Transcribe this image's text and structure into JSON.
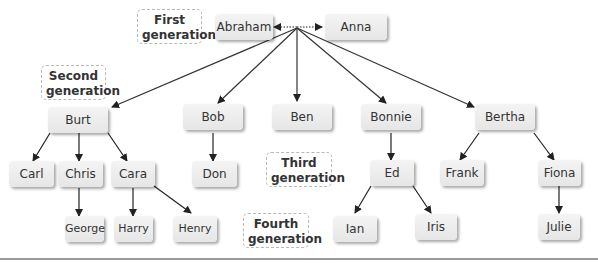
{
  "generation_labels": {
    "first": "First generation",
    "second": "Second generation",
    "third": "Third generation",
    "fourth": "Fourth generation"
  },
  "nodes": {
    "abraham": "Abraham",
    "anna": "Anna",
    "burt": "Burt",
    "bob": "Bob",
    "ben": "Ben",
    "bonnie": "Bonnie",
    "bertha": "Bertha",
    "carl": "Carl",
    "chris": "Chris",
    "cara": "Cara",
    "don": "Don",
    "ed": "Ed",
    "frank": "Frank",
    "fiona": "Fiona",
    "george": "George",
    "harry": "Harry",
    "henry": "Henry",
    "ian": "Ian",
    "iris": "Iris",
    "julie": "Julie"
  },
  "relationships": [
    {
      "from": "Abraham",
      "to": "Anna",
      "type": "spouse"
    },
    {
      "from": "Abraham/Anna",
      "to": "Burt",
      "type": "child"
    },
    {
      "from": "Abraham/Anna",
      "to": "Bob",
      "type": "child"
    },
    {
      "from": "Abraham/Anna",
      "to": "Ben",
      "type": "child"
    },
    {
      "from": "Abraham/Anna",
      "to": "Bonnie",
      "type": "child"
    },
    {
      "from": "Abraham/Anna",
      "to": "Bertha",
      "type": "child"
    },
    {
      "from": "Burt",
      "to": "Carl",
      "type": "child"
    },
    {
      "from": "Burt",
      "to": "Chris",
      "type": "child"
    },
    {
      "from": "Burt",
      "to": "Cara",
      "type": "child"
    },
    {
      "from": "Bob",
      "to": "Don",
      "type": "child"
    },
    {
      "from": "Bonnie",
      "to": "Ed",
      "type": "child"
    },
    {
      "from": "Bertha",
      "to": "Frank",
      "type": "child"
    },
    {
      "from": "Bertha",
      "to": "Fiona",
      "type": "child"
    },
    {
      "from": "Chris",
      "to": "George",
      "type": "child"
    },
    {
      "from": "Cara",
      "to": "Harry",
      "type": "child"
    },
    {
      "from": "Cara",
      "to": "Henry",
      "type": "child"
    },
    {
      "from": "Ed",
      "to": "Ian",
      "type": "child"
    },
    {
      "from": "Ed",
      "to": "Iris",
      "type": "child"
    },
    {
      "from": "Fiona",
      "to": "Julie",
      "type": "child"
    }
  ]
}
